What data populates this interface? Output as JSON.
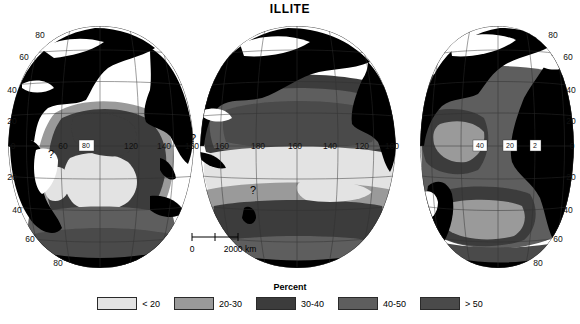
{
  "title": "ILLITE",
  "legend": {
    "heading": "Percent",
    "items": [
      {
        "label": "< 20",
        "color": "#e3e3e3"
      },
      {
        "label": "20-30",
        "color": "#9a9a9a"
      },
      {
        "label": "30-40",
        "color": "#3c3c3c"
      },
      {
        "label": "40-50",
        "color": "#5e5e5e"
      },
      {
        "label": "> 50",
        "color": "#4a4a4a"
      }
    ]
  },
  "scale_bar": {
    "start_label": "0",
    "end_label": "2000 km"
  },
  "map": {
    "projection": "interrupted-sinusoidal-goode",
    "land_color": "#000000",
    "ocean_nodata_color": "#ffffff",
    "graticule_color": "#303030",
    "outline_color": "#202020",
    "lobes": [
      {
        "name": "indian-ocean-lobe",
        "center_longitude": 100,
        "latitude_labels_left": [
          "80",
          "60",
          "40",
          "20",
          "0",
          "20",
          "40",
          "60",
          "80"
        ],
        "longitude_labels": [
          "60",
          "80",
          "120",
          "140",
          "160"
        ]
      },
      {
        "name": "pacific-ocean-lobe",
        "center_longitude": 180,
        "longitude_labels": [
          "160",
          "180",
          "160",
          "140",
          "120",
          "100"
        ]
      },
      {
        "name": "atlantic-ocean-lobe",
        "center_longitude": 20,
        "latitude_labels_right": [
          "80",
          "60",
          "40",
          "20",
          "0",
          "20",
          "40",
          "60",
          "80"
        ],
        "longitude_labels": [
          "40",
          "20",
          "2"
        ]
      }
    ],
    "uncertainty_markers": [
      {
        "name": "question-mark-arabian-sea",
        "symbol": "?"
      },
      {
        "name": "question-mark-indonesia",
        "symbol": "?"
      },
      {
        "name": "question-mark-australia-south",
        "symbol": "?"
      }
    ]
  }
}
